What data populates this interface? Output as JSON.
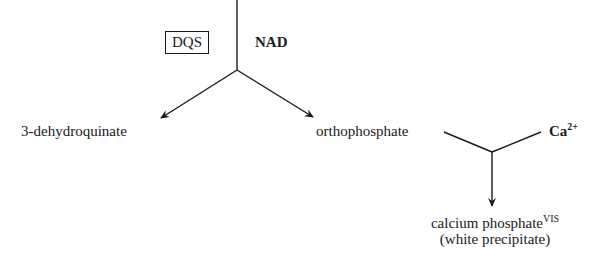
{
  "diagram": {
    "enzyme_box": "DQS",
    "cofactor": "NAD",
    "product_left": "3-dehydroquinate",
    "product_right": "orthophosphate",
    "reagent": "Ca",
    "reagent_charge": "2+",
    "final_product": "calcium phosphate",
    "final_product_sup": "VIS",
    "final_product_note": "(white precipitate)"
  },
  "colors": {
    "stroke": "#1a1a1a",
    "background": "#ffffff"
  }
}
